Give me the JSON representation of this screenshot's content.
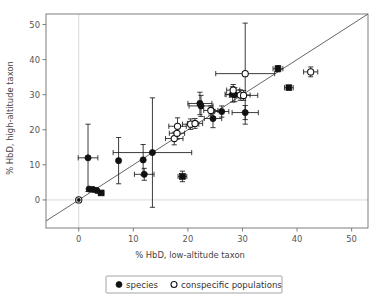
{
  "chart_data": {
    "type": "scatter",
    "title": "",
    "xlabel": "% HbD, low-altitude taxon",
    "ylabel": "% HbD, high-altitude taxon",
    "xlim": [
      -6,
      53
    ],
    "ylim": [
      -8,
      53
    ],
    "xticks": [
      0,
      10,
      20,
      30,
      40,
      50
    ],
    "yticks": [
      0,
      10,
      20,
      30,
      40,
      50
    ],
    "xtick_labels": [
      "0",
      "10",
      "20",
      "30",
      "40",
      "50"
    ],
    "ytick_labels": [
      "0",
      "10",
      "20",
      "30",
      "40",
      "50"
    ],
    "grid": false,
    "reference_line": {
      "type": "identity",
      "slope": 1,
      "intercept": 0,
      "label": "1:1 line"
    },
    "zero_lines": {
      "x": 0,
      "y": 0
    },
    "legend": {
      "position": "below-axes",
      "entries": [
        {
          "label": "species",
          "marker": "filled-circle"
        },
        {
          "label": "conspecific populations",
          "marker": "open-circle"
        }
      ]
    },
    "series": [
      {
        "name": "species",
        "marker": "filled-circle",
        "points": [
          {
            "x": 0.0,
            "y": 0.0,
            "xerr": 0.0,
            "yerr": 0.0,
            "marker": "filled-circle-open-ring"
          },
          {
            "x": 1.7,
            "y": 12.0,
            "xerr": 1.8,
            "yerr": 9.6
          },
          {
            "x": 1.9,
            "y": 3.1,
            "xerr": 0.0,
            "yerr": 0.0
          },
          {
            "x": 2.6,
            "y": 3.0,
            "xerr": 0.0,
            "yerr": 0.0
          },
          {
            "x": 3.3,
            "y": 2.7,
            "xerr": 0.0,
            "yerr": 0.0
          },
          {
            "x": 4.1,
            "y": 2.0,
            "xerr": 0.5,
            "yerr": 0.6,
            "marker": "filled-square"
          },
          {
            "x": 7.3,
            "y": 11.2,
            "xerr": 0.0,
            "yerr": 6.6
          },
          {
            "x": 11.8,
            "y": 11.4,
            "xerr": 0.0,
            "yerr": 4.4
          },
          {
            "x": 12.0,
            "y": 7.3,
            "xerr": 1.8,
            "yerr": 1.7
          },
          {
            "x": 13.5,
            "y": 13.5,
            "xerr": 7.2,
            "yerr": 15.6
          },
          {
            "x": 19.0,
            "y": 6.7,
            "xerr": 0.8,
            "yerr": 1.5,
            "marker": "filled-square"
          },
          {
            "x": 22.2,
            "y": 27.5,
            "xerr": 2.2,
            "yerr": 3.2
          },
          {
            "x": 22.4,
            "y": 26.8,
            "xerr": 2.2,
            "yerr": 3.0
          },
          {
            "x": 24.6,
            "y": 23.2,
            "xerr": 1.6,
            "yerr": 2.6
          },
          {
            "x": 26.2,
            "y": 25.2,
            "xerr": 1.3,
            "yerr": 1.6
          },
          {
            "x": 28.2,
            "y": 30.1,
            "xerr": 1.4,
            "yerr": 2.2
          },
          {
            "x": 28.6,
            "y": 30.0,
            "xerr": 1.6,
            "yerr": 2.0
          },
          {
            "x": 30.5,
            "y": 24.9,
            "xerr": 2.4,
            "yerr": 2.0
          },
          {
            "x": 36.5,
            "y": 37.4,
            "xerr": 0.9,
            "yerr": 0.9,
            "marker": "filled-square"
          },
          {
            "x": 38.5,
            "y": 32.0,
            "xerr": 0.8,
            "yerr": 0.0,
            "marker": "filled-square"
          }
        ]
      },
      {
        "name": "conspecific populations",
        "marker": "open-circle",
        "points": [
          {
            "x": 17.5,
            "y": 17.5,
            "xerr": 1.6,
            "yerr": 1.8
          },
          {
            "x": 18.0,
            "y": 19.0,
            "xerr": 1.4,
            "yerr": 1.7
          },
          {
            "x": 18.1,
            "y": 21.0,
            "xerr": 1.6,
            "yerr": 2.4
          },
          {
            "x": 20.5,
            "y": 21.6,
            "xerr": 1.5,
            "yerr": 1.5
          },
          {
            "x": 21.3,
            "y": 21.8,
            "xerr": 1.4,
            "yerr": 1.4
          },
          {
            "x": 24.2,
            "y": 25.5,
            "xerr": 1.3,
            "yerr": 1.3
          },
          {
            "x": 28.3,
            "y": 31.3,
            "xerr": 1.2,
            "yerr": 1.6
          },
          {
            "x": 29.6,
            "y": 29.9,
            "xerr": 1.8,
            "yerr": 1.5
          },
          {
            "x": 30.2,
            "y": 29.8,
            "xerr": 2.6,
            "yerr": 1.4
          },
          {
            "x": 30.5,
            "y": 36.0,
            "xerr": 5.4,
            "yerr": 14.4
          },
          {
            "x": 42.5,
            "y": 36.5,
            "xerr": 1.3,
            "yerr": 1.4
          }
        ]
      }
    ]
  },
  "colors": {
    "marker_fill": "#111111",
    "marker_stroke": "#111111",
    "open_fill": "#ffffff",
    "axis": "#6f6f6f",
    "zero_line": "#d8d5d2",
    "identity_line": "#4a4a4a",
    "text": "#3a3a3a",
    "background": "#ffffff"
  }
}
